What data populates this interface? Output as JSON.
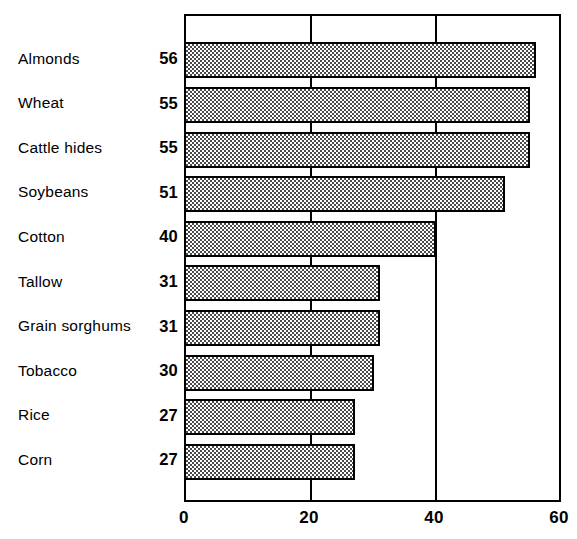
{
  "chart_data": {
    "type": "bar",
    "orientation": "horizontal",
    "title": "",
    "subtitle": "",
    "xlabel": "",
    "ylabel": "",
    "categories": [
      "Almonds",
      "Wheat",
      "Cattle hides",
      "Soybeans",
      "Cotton",
      "Tallow",
      "Grain sorghums",
      "Tobacco",
      "Rice",
      "Corn"
    ],
    "values": [
      56,
      55,
      55,
      51,
      40,
      31,
      31,
      30,
      27,
      27
    ],
    "value_labels": [
      "56",
      "55",
      "55",
      "51",
      "40",
      "31",
      "31",
      "30",
      "27",
      "27"
    ],
    "xlim": [
      0,
      60
    ],
    "xticks": [
      0,
      20,
      40,
      60
    ],
    "xtick_labels": [
      "0",
      "20",
      "40",
      "60"
    ],
    "gridlines": [
      20,
      40
    ],
    "grid": true,
    "legend": null,
    "annotations": [],
    "bar_fill": "checkerboard-dither-gray",
    "bar_fill_color": "#4a4a4a",
    "bar_edge_color": "#000000",
    "frame_color": "#000000",
    "background_color": "#ffffff"
  }
}
